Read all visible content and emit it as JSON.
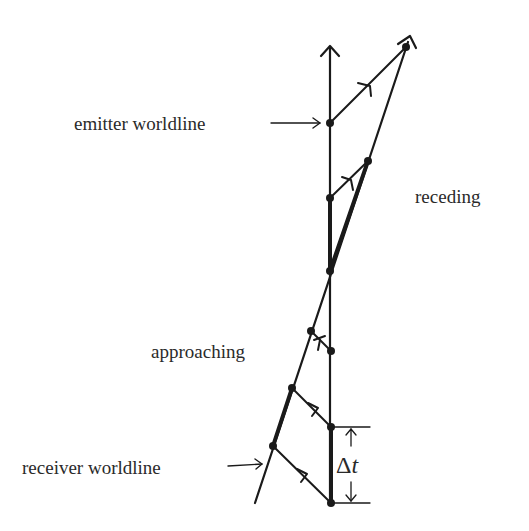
{
  "diagram": {
    "type": "spacetime-doppler",
    "stroke_color": "#1a1a1a",
    "labels": {
      "emitter": "emitter worldline",
      "receiver": "receiver worldline",
      "receding": "receding",
      "approaching": "approaching",
      "delta_t_symbol": "Δ",
      "delta_t_var": "t"
    },
    "emitter_worldline": {
      "x": 330,
      "y_top": 47,
      "y_bottom": 503
    },
    "receiver_worldline": {
      "x1": 255,
      "y1": 503,
      "x2": 406,
      "y2": 47
    },
    "events": [
      {
        "x": 406,
        "y": 47
      },
      {
        "x": 330,
        "y": 123
      },
      {
        "x": 368,
        "y": 161
      },
      {
        "x": 330,
        "y": 198
      },
      {
        "x": 330,
        "y": 271
      },
      {
        "x": 311,
        "y": 331
      },
      {
        "x": 331,
        "y": 351
      },
      {
        "x": 292,
        "y": 388
      },
      {
        "x": 331,
        "y": 427
      },
      {
        "x": 273,
        "y": 446
      },
      {
        "x": 331,
        "y": 503
      }
    ],
    "light_rays": [
      {
        "from": [
          330,
          123
        ],
        "to": [
          406,
          47
        ],
        "name": "receding-ray-1"
      },
      {
        "from": [
          330,
          198
        ],
        "to": [
          368,
          161
        ],
        "name": "receding-ray-2"
      },
      {
        "from": [
          331,
          351
        ],
        "to": [
          311,
          331
        ],
        "name": "approaching-ray-1"
      },
      {
        "from": [
          331,
          427
        ],
        "to": [
          292,
          388
        ],
        "name": "approaching-ray-2"
      },
      {
        "from": [
          331,
          503
        ],
        "to": [
          273,
          446
        ],
        "name": "approaching-ray-3"
      }
    ]
  }
}
